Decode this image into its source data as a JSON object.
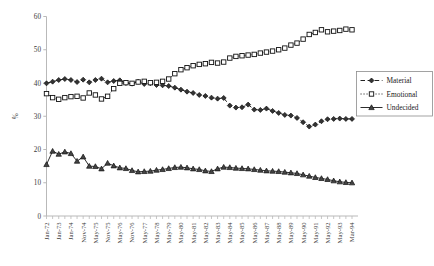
{
  "chart_data": {
    "type": "line",
    "title": "",
    "xlabel": "",
    "ylabel": "%",
    "ylim": [
      0,
      60
    ],
    "ytickstep": 10,
    "yticks": [
      "0",
      "10",
      "20",
      "30",
      "40",
      "50",
      "60"
    ],
    "grid": false,
    "legend_position": "right-middle",
    "x": [
      "Jan-72",
      "Jul-72",
      "Jan-73",
      "Jul-73",
      "Jan-74",
      "Jul-74",
      "Nov-74",
      "Feb-75",
      "May-75",
      "Aug-75",
      "Nov-75",
      "Feb-76",
      "May-76",
      "Aug-76",
      "Nov-76",
      "Feb-77",
      "May-77",
      "Nov-77",
      "May-78",
      "Nov-78",
      "May-79",
      "Nov-79",
      "May-80",
      "Nov-80",
      "May-81",
      "Nov-81",
      "May-82",
      "Nov-82",
      "May-83",
      "Nov-83",
      "May-84",
      "Nov-84",
      "May-85",
      "Nov-85",
      "May-86",
      "Nov-86",
      "May-87",
      "Nov-87",
      "May-88",
      "Nov-88",
      "May-89",
      "Nov-89",
      "May-90",
      "Nov-90",
      "May-91",
      "Nov-91",
      "May-92",
      "Nov-92",
      "May-93",
      "Nov-93",
      "Mar-94"
    ],
    "xtick_labels": [
      "Jan-72",
      "Jan-73",
      "Jan-74",
      "Nov-74",
      "May-75",
      "Nov-75",
      "May-76",
      "Nov-76",
      "May-77",
      "May-78",
      "May-79",
      "May-80",
      "May-81",
      "May-82",
      "May-83",
      "May-84",
      "May-85",
      "May-86",
      "May-87",
      "May-88",
      "May-89",
      "May-90",
      "May-91",
      "May-92",
      "May-93",
      "Mar-94"
    ],
    "series": [
      {
        "name": "Material",
        "marker": "diamond",
        "line_style": "dashed",
        "color": "#222222",
        "values": [
          39.9,
          40.4,
          40.9,
          41.2,
          40.9,
          40.3,
          41.0,
          40.2,
          40.9,
          41.3,
          40.2,
          40.6,
          40.8,
          40.0,
          39.8,
          40.4,
          39.7,
          39.9,
          39.4,
          39.3,
          39.1,
          38.6,
          38.0,
          37.4,
          37.0,
          36.4,
          36.1,
          35.6,
          35.3,
          35.5,
          33.2,
          32.6,
          32.7,
          33.5,
          32.0,
          31.9,
          32.3,
          31.6,
          31.0,
          30.4,
          30.2,
          29.5,
          28.2,
          26.9,
          27.5,
          28.5,
          29.1,
          29.2,
          29.3,
          29.2,
          29.2
        ]
      },
      {
        "name": "Emotional",
        "marker": "square",
        "line_style": "dotted",
        "color": "#222222",
        "values": [
          36.8,
          35.6,
          35.1,
          35.6,
          35.9,
          36.0,
          35.5,
          37.0,
          36.4,
          35.2,
          36.0,
          38.3,
          39.9,
          40.1,
          39.9,
          40.3,
          40.5,
          40.1,
          40.2,
          40.5,
          41.2,
          42.8,
          44.0,
          44.6,
          45.2,
          45.6,
          45.8,
          46.2,
          46.0,
          46.3,
          47.5,
          48.0,
          48.2,
          48.4,
          48.6,
          49.0,
          49.3,
          49.6,
          50.0,
          50.5,
          51.4,
          52.0,
          53.2,
          54.6,
          55.2,
          56.0,
          55.4,
          55.6,
          55.8,
          56.2,
          56.0
        ]
      },
      {
        "name": "Undecided",
        "marker": "triangle",
        "line_style": "solid",
        "color": "#222222",
        "values": [
          15.5,
          19.5,
          18.6,
          19.3,
          18.8,
          16.5,
          17.8,
          15.0,
          14.9,
          14.2,
          15.9,
          15.1,
          14.5,
          14.3,
          13.7,
          13.3,
          13.4,
          13.5,
          13.8,
          14.0,
          14.3,
          14.6,
          14.7,
          14.5,
          14.2,
          14.0,
          13.6,
          13.4,
          14.2,
          14.7,
          14.6,
          14.4,
          14.3,
          14.2,
          14.0,
          13.8,
          13.6,
          13.5,
          13.4,
          13.2,
          13.0,
          12.8,
          12.4,
          12.0,
          11.6,
          11.3,
          11.0,
          10.6,
          10.3,
          10.1,
          10.0
        ]
      }
    ]
  },
  "legend": {
    "items": [
      {
        "label": "Material"
      },
      {
        "label": "Emotional"
      },
      {
        "label": "Undecided"
      }
    ]
  }
}
